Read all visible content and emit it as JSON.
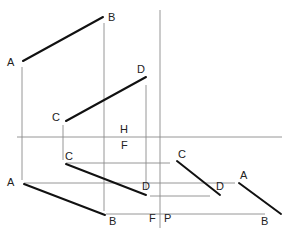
{
  "diagram": {
    "type": "orthographic-projection",
    "colors": {
      "edge": "#111111",
      "projector": "#8a8a8a",
      "label": "#222222"
    },
    "plane_labels": {
      "horizontal_above": "H",
      "horizontal_below": "F",
      "vertical_left": "F",
      "vertical_right": "P"
    },
    "top_view": {
      "points": {
        "A": "A",
        "B": "B",
        "C": "C",
        "D": "D"
      }
    },
    "front_view": {
      "points": {
        "A": "A",
        "B": "B",
        "C": "C",
        "D": "D"
      }
    },
    "profile_view": {
      "points": {
        "A": "A",
        "B": "B",
        "C": "C",
        "D": "D"
      }
    }
  }
}
